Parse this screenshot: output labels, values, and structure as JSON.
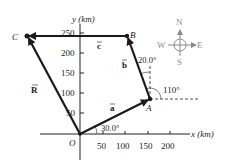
{
  "figure": {
    "axes": {
      "x_label": "x (km)",
      "y_label": "y (km)",
      "x_ticks": [
        "50",
        "100",
        "150",
        "200"
      ],
      "y_ticks": [
        "50",
        "100",
        "150",
        "200",
        "250"
      ],
      "origin_label": "O"
    },
    "points": {
      "O": "O",
      "A": "A",
      "B": "B",
      "C": "C"
    },
    "vectors": {
      "a": {
        "label": "a",
        "from": "O",
        "to": "A"
      },
      "b": {
        "label": "b",
        "from": "A",
        "to": "B"
      },
      "c": {
        "label": "c",
        "from": "B",
        "to": "C"
      },
      "R": {
        "label": "R",
        "from": "O",
        "to": "C"
      }
    },
    "angles": {
      "a_angle": "30.0°",
      "b_angle": "20.0°",
      "b_direction_angle": "110°"
    },
    "compass": {
      "north": "N",
      "south": "S",
      "east": "E",
      "west": "W"
    },
    "colors": {
      "vector": "#1a1a1a",
      "axis": "#222222",
      "compass": "#8a8a8a"
    }
  }
}
